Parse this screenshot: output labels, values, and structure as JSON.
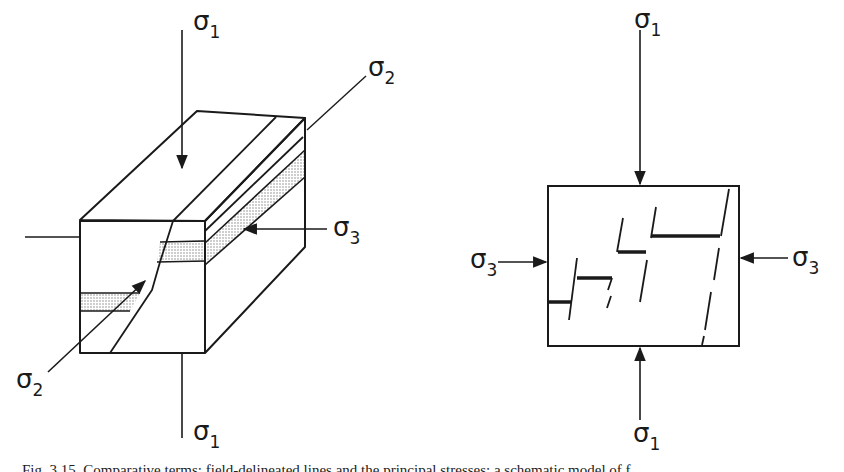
{
  "figure": {
    "left_diagram": {
      "title": "block-diagram-with-fault",
      "labels": {
        "sigma1_top": "σ",
        "sigma1_top_sub": "1",
        "sigma2_top": "σ",
        "sigma2_top_sub": "2",
        "sigma3": "σ",
        "sigma3_sub": "3",
        "sigma2_bottom": "σ",
        "sigma2_bottom_sub": "2",
        "sigma1_bottom": "σ",
        "sigma1_bottom_sub": "1"
      }
    },
    "right_diagram": {
      "title": "cross-section-with-offset-layers",
      "labels": {
        "sigma1_top": "σ",
        "sigma1_top_sub": "1",
        "sigma3_left": "σ",
        "sigma3_left_sub": "3",
        "sigma3_right": "σ",
        "sigma3_right_sub": "3",
        "sigma1_bottom": "σ",
        "sigma1_bottom_sub": "1"
      }
    },
    "caption": "Fig. 3.15. Comparative terms; field-delineated lines and the principal stresses; a schematic model of f"
  },
  "colors": {
    "ink": "#1a1a1a",
    "shade": "#c8c8c8",
    "background": "#ffffff"
  }
}
